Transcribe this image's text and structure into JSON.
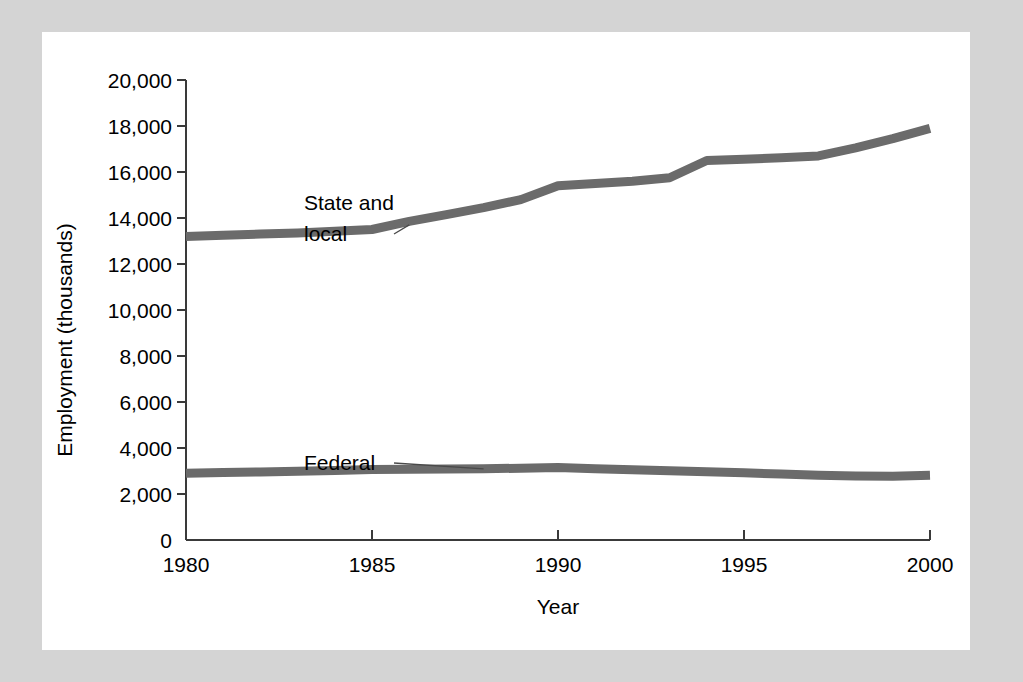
{
  "figure": {
    "background_color": "#d4d4d4",
    "panel_color": "#ffffff",
    "line_color": "#6b6b6b",
    "axis_color": "#3a3a3a"
  },
  "chart_data": {
    "type": "line",
    "title": "",
    "xlabel": "Year",
    "ylabel": "Employment (thousands)",
    "xlim": [
      1980,
      2000
    ],
    "ylim": [
      0,
      20000
    ],
    "grid": false,
    "legend_position": "inline-annotations",
    "xticks": [
      1980,
      1985,
      1990,
      1995,
      2000
    ],
    "xtick_labels": [
      "1980",
      "1985",
      "1990",
      "1995",
      "2000"
    ],
    "yticks": [
      0,
      2000,
      4000,
      6000,
      8000,
      10000,
      12000,
      14000,
      16000,
      18000,
      20000
    ],
    "ytick_labels": [
      "0",
      "2,000",
      "4,000",
      "6,000",
      "8,000",
      "10,000",
      "12,000",
      "14,000",
      "16,000",
      "18,000",
      "20,000"
    ],
    "x": [
      1980,
      1981,
      1982,
      1983,
      1984,
      1985,
      1986,
      1987,
      1988,
      1989,
      1990,
      1991,
      1992,
      1993,
      1994,
      1995,
      1996,
      1997,
      1998,
      1999,
      2000
    ],
    "series": [
      {
        "name": "State and local",
        "values": [
          13200,
          13250,
          13300,
          13350,
          13420,
          13500,
          13850,
          14150,
          14450,
          14800,
          15400,
          15500,
          15600,
          15750,
          16500,
          16550,
          16620,
          16700,
          17050,
          17450,
          17900
        ]
      },
      {
        "name": "Federal",
        "values": [
          2900,
          2930,
          2960,
          2990,
          3020,
          3060,
          3080,
          3090,
          3100,
          3120,
          3150,
          3100,
          3050,
          3010,
          2970,
          2920,
          2870,
          2820,
          2780,
          2770,
          2820
        ]
      }
    ],
    "annotations": [
      {
        "text_line_1": "State and",
        "text_line_2": "local",
        "points_to_year": 1986,
        "points_to_value": 13700
      },
      {
        "text_line_1": "Federal",
        "text_line_2": "",
        "points_to_year": 1988,
        "points_to_value": 3090
      }
    ]
  }
}
